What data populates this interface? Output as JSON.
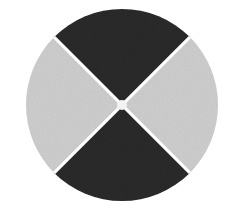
{
  "image": {
    "title": "Four-sector circular disc",
    "description": "A filled circle divided by two perpendicular diagonal white dividers into four equal sectors; the top and bottom sectors are near-black, the left and right sectors are light grey, with a small white hub at the centre.",
    "background_color": "#ffffff",
    "canvas": {
      "width": 238,
      "height": 208
    }
  },
  "disc": {
    "center_x": 122,
    "center_y": 105,
    "radius": 96,
    "outline_color": "#ffffff",
    "divider_color": "#ffffff",
    "divider_width": 3,
    "hub": {
      "label": "center-hub",
      "radius": 5,
      "color": "#f2f2f2"
    },
    "sectors": [
      {
        "label": "top-sector",
        "position": "top",
        "color": "#262626",
        "tone": "dark",
        "start_angle": 225,
        "end_angle": 315,
        "span_degrees": 90
      },
      {
        "label": "right-sector",
        "position": "right",
        "color": "#c6c6c6",
        "tone": "light",
        "start_angle": 315,
        "end_angle": 45,
        "span_degrees": 90
      },
      {
        "label": "bottom-sector",
        "position": "bottom",
        "color": "#262626",
        "tone": "dark",
        "start_angle": 45,
        "end_angle": 135,
        "span_degrees": 90
      },
      {
        "label": "left-sector",
        "position": "left",
        "color": "#c6c6c6",
        "tone": "light",
        "start_angle": 135,
        "end_angle": 225,
        "span_degrees": 90
      }
    ]
  },
  "texture": {
    "name": "film-grain",
    "present": true,
    "strength": 0.55
  }
}
